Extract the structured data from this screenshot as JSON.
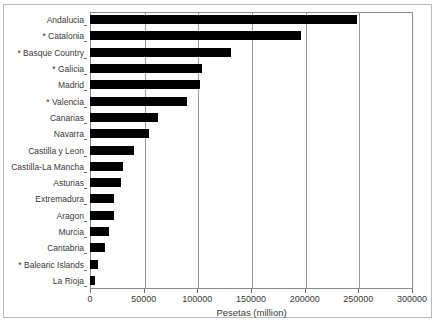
{
  "chart_data": {
    "type": "bar",
    "orientation": "horizontal",
    "title": "",
    "xlabel": "Pesetas (million)",
    "ylabel": "",
    "xlim": [
      0,
      300000
    ],
    "xticks": [
      0,
      50000,
      100000,
      150000,
      200000,
      250000,
      300000
    ],
    "xtick_labels": [
      "0",
      "50000",
      "100000",
      "150000",
      "200000",
      "250000",
      "300000"
    ],
    "grid": true,
    "grid_axis": "x",
    "legend": null,
    "bar_color": "#000000",
    "categories": [
      "Andalucia",
      "* Catalonia",
      "* Basque Country",
      "* Galicia",
      "Madrid",
      "* Valencia",
      "Canarias",
      "Navarra",
      "Castilla y Leon",
      "Castilla-La Mancha",
      "Asturias",
      "Extremadura",
      "Aragon",
      "Murcia",
      "Cantabria",
      "* Balearic Islands",
      "La Rioja"
    ],
    "values": [
      249000,
      197000,
      131000,
      104000,
      102000,
      90000,
      63000,
      55000,
      41000,
      31000,
      28500,
      22500,
      22000,
      17500,
      14000,
      7500,
      4500
    ]
  }
}
